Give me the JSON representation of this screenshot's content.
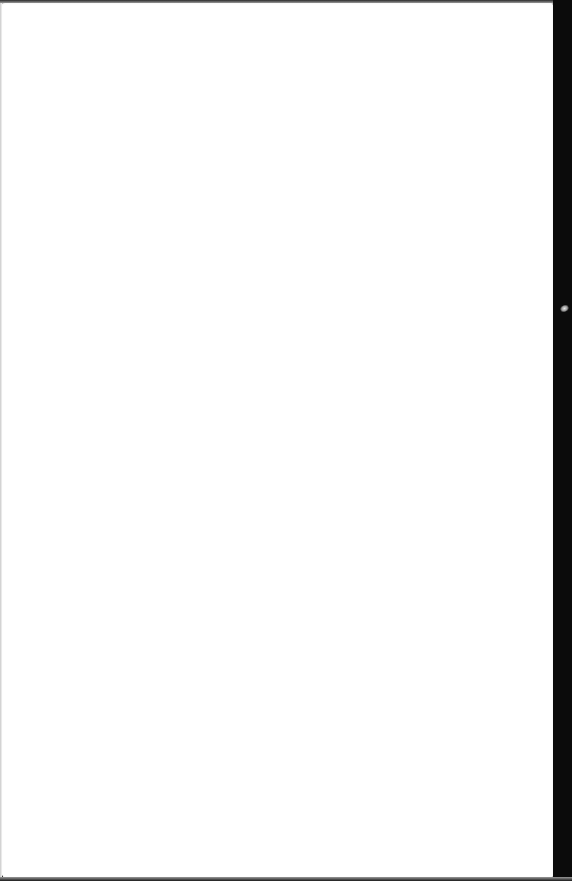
{
  "document": {
    "type": "scanned-page",
    "content": "",
    "page_color": "#ffffff",
    "edge_color": "#0b0b0b"
  }
}
